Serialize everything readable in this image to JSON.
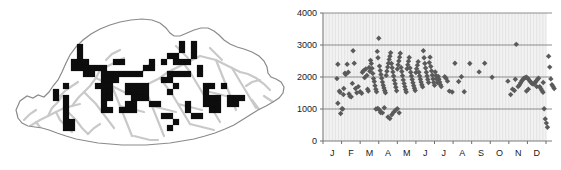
{
  "figure": {
    "panels": [
      "distribution-map",
      "altitude-scatter"
    ],
    "background_color": "#ffffff"
  },
  "map": {
    "name": "bhutan-distribution-map",
    "outline_color": "#8a8a8a",
    "terrain_color": "#c9c9c9",
    "record_marker_color": "#0d0d0d",
    "record_marker_shape": "square",
    "outline_path": "M 18,118 L 16,110 L 20,101 L 27,96 L 33,98 L 38,95 L 44,97 L 49,92 L 53,86 L 58,80 L 62,72 L 66,63 L 70,55 L 76,47 L 83,40 L 91,34 L 100,29 L 110,25 L 120,22 L 131,20 L 142,19 L 152,20 L 160,23 L 166,28 L 170,33 L 174,36 L 180,36 L 187,33 L 194,30 L 201,28 L 208,28 L 214,31 L 219,35 L 224,40 L 230,44 L 237,47 L 244,49 L 252,52 L 259,56 L 264,61 L 267,67 L 268,73 L 271,77 L 276,79 L 281,82 L 284,87 L 283,93 L 279,98 L 273,102 L 266,106 L 258,110 L 250,115 L 242,120 L 234,125 L 225,129 L 215,133 L 205,136 L 194,139 L 182,141 L 170,143 L 158,144 L 146,145 L 134,145 L 122,145 L 110,144 L 98,143 L 87,141 L 76,139 L 66,136 L 57,133 L 49,130 L 42,128 L 35,127 L 28,126 L 22,123 Z",
    "record_squares": [
      [
        80,
        47
      ],
      [
        80,
        53
      ],
      [
        80,
        59
      ],
      [
        74,
        62
      ],
      [
        80,
        62
      ],
      [
        86,
        62
      ],
      [
        74,
        68
      ],
      [
        80,
        68
      ],
      [
        86,
        68
      ],
      [
        92,
        68
      ],
      [
        98,
        68
      ],
      [
        104,
        68
      ],
      [
        86,
        74
      ],
      [
        92,
        74
      ],
      [
        104,
        74
      ],
      [
        110,
        74
      ],
      [
        116,
        74
      ],
      [
        104,
        80
      ],
      [
        110,
        80
      ],
      [
        116,
        80
      ],
      [
        98,
        86
      ],
      [
        104,
        86
      ],
      [
        110,
        86
      ],
      [
        104,
        92
      ],
      [
        110,
        92
      ],
      [
        104,
        98
      ],
      [
        110,
        98
      ],
      [
        66,
        86
      ],
      [
        66,
        98
      ],
      [
        66,
        104
      ],
      [
        66,
        110
      ],
      [
        66,
        116
      ],
      [
        66,
        122
      ],
      [
        72,
        122
      ],
      [
        66,
        128
      ],
      [
        72,
        128
      ],
      [
        104,
        104
      ],
      [
        104,
        110
      ],
      [
        110,
        110
      ],
      [
        122,
        74
      ],
      [
        128,
        74
      ],
      [
        134,
        74
      ],
      [
        140,
        74
      ],
      [
        146,
        68
      ],
      [
        152,
        68
      ],
      [
        128,
        86
      ],
      [
        134,
        86
      ],
      [
        140,
        86
      ],
      [
        146,
        86
      ],
      [
        128,
        92
      ],
      [
        134,
        92
      ],
      [
        140,
        92
      ],
      [
        146,
        92
      ],
      [
        134,
        98
      ],
      [
        140,
        98
      ],
      [
        146,
        98
      ],
      [
        128,
        104
      ],
      [
        134,
        104
      ],
      [
        122,
        110
      ],
      [
        128,
        110
      ],
      [
        134,
        110
      ],
      [
        152,
        62
      ],
      [
        164,
        62
      ],
      [
        170,
        56
      ],
      [
        176,
        56
      ],
      [
        176,
        62
      ],
      [
        182,
        62
      ],
      [
        188,
        62
      ],
      [
        170,
        74
      ],
      [
        176,
        74
      ],
      [
        182,
        74
      ],
      [
        188,
        74
      ],
      [
        164,
        80
      ],
      [
        170,
        80
      ],
      [
        176,
        86
      ],
      [
        170,
        92
      ],
      [
        182,
        50
      ],
      [
        182,
        44
      ],
      [
        194,
        44
      ],
      [
        194,
        50
      ],
      [
        194,
        56
      ],
      [
        200,
        68
      ],
      [
        200,
        74
      ],
      [
        206,
        86
      ],
      [
        212,
        86
      ],
      [
        206,
        92
      ],
      [
        206,
        98
      ],
      [
        212,
        98
      ],
      [
        218,
        98
      ],
      [
        206,
        104
      ],
      [
        212,
        104
      ],
      [
        218,
        104
      ],
      [
        224,
        86
      ],
      [
        230,
        98
      ],
      [
        236,
        98
      ],
      [
        230,
        104
      ],
      [
        236,
        104
      ],
      [
        176,
        122
      ],
      [
        170,
        128
      ],
      [
        194,
        116
      ],
      [
        200,
        116
      ],
      [
        242,
        98
      ],
      [
        170,
        116
      ],
      [
        164,
        116
      ],
      [
        122,
        62
      ],
      [
        116,
        62
      ],
      [
        152,
        104
      ],
      [
        158,
        104
      ],
      [
        188,
        104
      ],
      [
        188,
        110
      ],
      [
        212,
        110
      ],
      [
        218,
        110
      ],
      [
        56,
        92
      ],
      [
        56,
        98
      ]
    ]
  },
  "chart_data": {
    "type": "scatter",
    "name": "altitude-by-month-scatter",
    "title": "",
    "xlabel": "",
    "ylabel": "",
    "xlim": [
      0,
      12
    ],
    "ylim": [
      0,
      4000
    ],
    "grid": true,
    "legend_position": "none",
    "marker_shape": "diamond",
    "marker_color": "#5a5a5a",
    "plot_background": "#f2f2f2",
    "gridline_color": "#8c8c8c",
    "y_ticks": [
      0,
      1000,
      2000,
      3000,
      4000
    ],
    "y_tick_labels": [
      "0",
      "1000",
      "2000",
      "3000",
      "4000"
    ],
    "x_tick_labels": [
      "J",
      "F",
      "M",
      "A",
      "M",
      "J",
      "J",
      "A",
      "S",
      "O",
      "N",
      "D"
    ],
    "x_tick_months": [
      "January",
      "February",
      "March",
      "April",
      "May",
      "June",
      "July",
      "August",
      "September",
      "October",
      "November",
      "December"
    ],
    "points": [
      [
        0.25,
        1950
      ],
      [
        0.3,
        2400
      ],
      [
        0.38,
        1560
      ],
      [
        0.42,
        1520
      ],
      [
        0.3,
        1180
      ],
      [
        0.45,
        860
      ],
      [
        0.52,
        1010
      ],
      [
        0.56,
        1000
      ],
      [
        0.6,
        1450
      ],
      [
        0.62,
        1640
      ],
      [
        0.68,
        2120
      ],
      [
        0.72,
        2080
      ],
      [
        0.8,
        2400
      ],
      [
        0.86,
        2150
      ],
      [
        0.9,
        1470
      ],
      [
        0.95,
        1400
      ],
      [
        1.02,
        1380
      ],
      [
        1.08,
        1800
      ],
      [
        1.12,
        2820
      ],
      [
        1.18,
        2430
      ],
      [
        1.25,
        1640
      ],
      [
        1.32,
        1510
      ],
      [
        1.4,
        1700
      ],
      [
        1.5,
        1540
      ],
      [
        1.58,
        1490
      ],
      [
        1.62,
        2150
      ],
      [
        1.68,
        2200
      ],
      [
        1.74,
        1980
      ],
      [
        1.8,
        2250
      ],
      [
        1.86,
        2050
      ],
      [
        1.9,
        1620
      ],
      [
        1.94,
        1560
      ],
      [
        1.98,
        2300
      ],
      [
        2.02,
        2180
      ],
      [
        2.06,
        2520
      ],
      [
        2.1,
        2420
      ],
      [
        2.14,
        2270
      ],
      [
        2.18,
        2110
      ],
      [
        2.22,
        1950
      ],
      [
        2.26,
        1860
      ],
      [
        2.3,
        1730
      ],
      [
        2.34,
        1620
      ],
      [
        2.38,
        1540
      ],
      [
        2.42,
        2800
      ],
      [
        2.46,
        2600
      ],
      [
        2.5,
        3210
      ],
      [
        2.54,
        2340
      ],
      [
        2.58,
        2200
      ],
      [
        2.62,
        2080
      ],
      [
        2.66,
        1960
      ],
      [
        2.7,
        1840
      ],
      [
        2.74,
        1740
      ],
      [
        2.78,
        1660
      ],
      [
        2.82,
        1580
      ],
      [
        2.86,
        1510
      ],
      [
        2.9,
        2050
      ],
      [
        2.94,
        2180
      ],
      [
        2.98,
        2310
      ],
      [
        3.02,
        2430
      ],
      [
        3.06,
        2550
      ],
      [
        3.1,
        2650
      ],
      [
        3.14,
        2760
      ],
      [
        3.18,
        2420
      ],
      [
        3.22,
        2290
      ],
      [
        3.26,
        2160
      ],
      [
        3.3,
        2030
      ],
      [
        3.34,
        1900
      ],
      [
        3.38,
        1790
      ],
      [
        3.42,
        1680
      ],
      [
        3.46,
        1570
      ],
      [
        3.5,
        2250
      ],
      [
        3.54,
        2380
      ],
      [
        3.58,
        2500
      ],
      [
        3.62,
        2620
      ],
      [
        3.66,
        2740
      ],
      [
        3.7,
        2300
      ],
      [
        3.74,
        2170
      ],
      [
        3.78,
        2040
      ],
      [
        3.82,
        1910
      ],
      [
        3.86,
        1800
      ],
      [
        3.9,
        1700
      ],
      [
        3.94,
        1610
      ],
      [
        3.98,
        1530
      ],
      [
        4.02,
        2260
      ],
      [
        4.06,
        2380
      ],
      [
        4.1,
        2490
      ],
      [
        4.14,
        2610
      ],
      [
        4.18,
        2280
      ],
      [
        4.22,
        2150
      ],
      [
        4.26,
        2030
      ],
      [
        4.3,
        1920
      ],
      [
        4.34,
        1820
      ],
      [
        4.38,
        1730
      ],
      [
        4.42,
        1650
      ],
      [
        4.46,
        1580
      ],
      [
        4.5,
        2140
      ],
      [
        4.54,
        2260
      ],
      [
        4.58,
        2370
      ],
      [
        4.62,
        2480
      ],
      [
        4.66,
        2150
      ],
      [
        4.7,
        2030
      ],
      [
        4.74,
        1930
      ],
      [
        4.78,
        1840
      ],
      [
        4.82,
        1760
      ],
      [
        4.86,
        1690
      ],
      [
        4.9,
        2820
      ],
      [
        4.94,
        2600
      ],
      [
        4.98,
        2420
      ],
      [
        5.02,
        2280
      ],
      [
        5.06,
        2150
      ],
      [
        5.1,
        2030
      ],
      [
        5.14,
        1920
      ],
      [
        5.18,
        1830
      ],
      [
        5.22,
        2450
      ],
      [
        5.26,
        2620
      ],
      [
        5.3,
        2330
      ],
      [
        5.34,
        2190
      ],
      [
        5.38,
        2060
      ],
      [
        5.42,
        1940
      ],
      [
        5.46,
        1830
      ],
      [
        5.5,
        1740
      ],
      [
        5.54,
        2160
      ],
      [
        5.58,
        2040
      ],
      [
        5.62,
        1930
      ],
      [
        5.66,
        1830
      ],
      [
        5.7,
        2020
      ],
      [
        5.74,
        1930
      ],
      [
        5.78,
        1840
      ],
      [
        5.82,
        1760
      ],
      [
        5.86,
        1700
      ],
      [
        2.45,
        1020
      ],
      [
        2.55,
        960
      ],
      [
        2.6,
        890
      ],
      [
        2.7,
        880
      ],
      [
        3.0,
        750
      ],
      [
        3.1,
        700
      ],
      [
        3.2,
        820
      ],
      [
        3.3,
        900
      ],
      [
        3.4,
        960
      ],
      [
        3.5,
        1010
      ],
      [
        3.6,
        880
      ],
      [
        2.8,
        1040
      ],
      [
        2.35,
        1000
      ],
      [
        6.05,
        2010
      ],
      [
        6.12,
        1960
      ],
      [
        6.2,
        1870
      ],
      [
        6.3,
        1560
      ],
      [
        6.45,
        1530
      ],
      [
        6.6,
        2430
      ],
      [
        6.8,
        1860
      ],
      [
        7.1,
        1540
      ],
      [
        7.4,
        2420
      ],
      [
        7.9,
        2160
      ],
      [
        8.2,
        2430
      ],
      [
        8.6,
        1990
      ],
      [
        9.45,
        1870
      ],
      [
        9.6,
        1450
      ],
      [
        9.7,
        1620
      ],
      [
        9.8,
        1580
      ],
      [
        9.9,
        3020
      ],
      [
        10.0,
        1700
      ],
      [
        10.08,
        1760
      ],
      [
        10.14,
        1820
      ],
      [
        10.2,
        1880
      ],
      [
        10.26,
        1930
      ],
      [
        10.32,
        1960
      ],
      [
        10.38,
        1980
      ],
      [
        10.44,
        1990
      ],
      [
        10.5,
        1970
      ],
      [
        10.56,
        1930
      ],
      [
        10.62,
        1880
      ],
      [
        10.68,
        1840
      ],
      [
        10.74,
        1800
      ],
      [
        10.8,
        1780
      ],
      [
        10.86,
        1790
      ],
      [
        10.92,
        1830
      ],
      [
        10.98,
        1880
      ],
      [
        11.04,
        1930
      ],
      [
        11.1,
        1960
      ],
      [
        11.16,
        1700
      ],
      [
        11.22,
        1640
      ],
      [
        11.28,
        1580
      ],
      [
        11.34,
        1520
      ],
      [
        11.4,
        1010
      ],
      [
        11.46,
        690
      ],
      [
        11.52,
        560
      ],
      [
        11.58,
        430
      ],
      [
        11.64,
        2650
      ],
      [
        11.7,
        2310
      ],
      [
        11.76,
        1940
      ],
      [
        11.82,
        1760
      ],
      [
        11.88,
        1700
      ],
      [
        11.94,
        1640
      ],
      [
        9.85,
        1930
      ],
      [
        10.45,
        1560
      ],
      [
        10.55,
        1620
      ],
      [
        11.0,
        1700
      ],
      [
        11.35,
        1830
      ],
      [
        6.95,
        2010
      ]
    ]
  }
}
